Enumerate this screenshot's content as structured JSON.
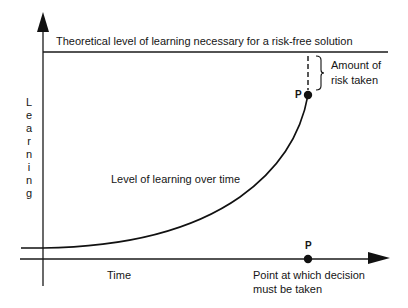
{
  "diagram": {
    "top_line_label": "Theoretical level of learning necessary for a risk-free solution",
    "y_axis_label": "Learning",
    "y_axis_letters": [
      "L",
      "e",
      "a",
      "r",
      "n",
      "i",
      "n",
      "g"
    ],
    "x_axis_label": "Time",
    "curve_label": "Level of learning over time",
    "risk_label_line1": "Amount of",
    "risk_label_line2": "risk taken",
    "point_top_label": "P",
    "point_bottom_label": "P",
    "decision_label_line1": "Point at which decision",
    "decision_label_line2": "must be taken",
    "colors": {
      "line": "#1a1a1a",
      "background": "#ffffff"
    }
  }
}
